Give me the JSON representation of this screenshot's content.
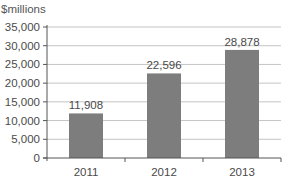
{
  "chart_data": {
    "type": "bar",
    "title": "",
    "unit_label": "$millions",
    "xlabel": "",
    "ylabel": "$millions",
    "categories": [
      "2011",
      "2012",
      "2013"
    ],
    "values": [
      11908,
      22596,
      28878
    ],
    "value_labels": [
      "11,908",
      "22,596",
      "28,878"
    ],
    "ylim": [
      0,
      35000
    ],
    "yticks": [
      0,
      5000,
      10000,
      15000,
      20000,
      25000,
      30000,
      35000
    ],
    "ytick_labels": [
      "0",
      "5,000",
      "10,000",
      "15,000",
      "20,000",
      "25,000",
      "30,000",
      "35,000"
    ],
    "grid": true,
    "legend": null,
    "colors": {
      "bar": "#7d7d7d",
      "grid": "#c4c4c4",
      "axis": "#555555",
      "text": "#4a4a4a"
    }
  }
}
